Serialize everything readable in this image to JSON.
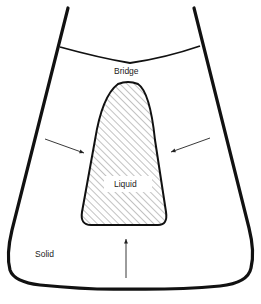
{
  "diagram": {
    "labels": {
      "bridge": "Bridge",
      "liquid": "Liquid",
      "solid": "Solid"
    },
    "colors": {
      "stroke": "#111111",
      "hatch": "#555555",
      "background": "#ffffff"
    }
  }
}
